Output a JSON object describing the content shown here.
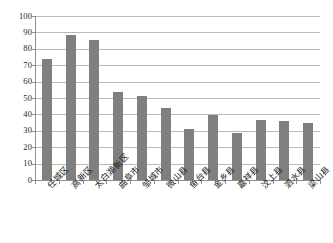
{
  "chart_data": {
    "type": "bar",
    "title": "",
    "subtitle": "",
    "xlabel": "",
    "ylabel": "",
    "ylim": [
      0,
      100
    ],
    "yticks": [
      0,
      10,
      20,
      30,
      40,
      50,
      60,
      70,
      80,
      90,
      100
    ],
    "ytick_labels": [
      "0",
      "10",
      "20",
      "30",
      "40",
      "50",
      "60",
      "70",
      "80",
      "90",
      "100"
    ],
    "grid": true,
    "legend": false,
    "legend_position": "none",
    "bar_color": "#7f7f7f",
    "gridline_color": "#b9b9b9",
    "axis_color": "#8f8f8f",
    "categories": [
      "任城区",
      "高新区",
      "太白湖新区",
      "曲阜市",
      "邹城市",
      "微山县",
      "鱼台县",
      "金乡县",
      "嘉祥县",
      "汶上县",
      "泗水县",
      "梁山县"
    ],
    "values": [
      74,
      88.5,
      85.5,
      53.5,
      51,
      44,
      31,
      39.5,
      28.5,
      36.5,
      36,
      34.5
    ],
    "series": [
      {
        "name": "",
        "values": [
          74,
          88.5,
          85.5,
          53.5,
          51,
          44,
          31,
          39.5,
          28.5,
          36.5,
          36,
          34.5
        ]
      }
    ]
  }
}
